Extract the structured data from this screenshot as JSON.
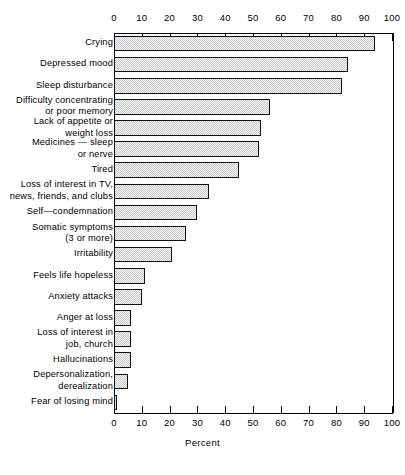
{
  "chart_data": {
    "type": "bar",
    "orientation": "horizontal",
    "title": "",
    "xlabel": "Percent",
    "ylabel": "",
    "xlim": [
      0,
      100
    ],
    "grid": false,
    "legend": null,
    "tick_labels": [
      "0",
      "10",
      "20",
      "30",
      "40",
      "50",
      "60",
      "70",
      "80",
      "90",
      "100"
    ],
    "tick_values": [
      0,
      10,
      20,
      30,
      40,
      50,
      60,
      70,
      80,
      90,
      100
    ],
    "categories": [
      "Crying",
      "Depressed mood",
      "Sleep disturbance",
      "Difficulty concentrating\nor poor memory",
      "Lack of appetite or\nweight loss",
      "Medicines — sleep\nor nerve",
      "Tired",
      "Loss of interest in TV,\nnews, friends, and clubs",
      "Self—condemnation",
      "Somatic symptoms\n(3 or more)",
      "Irritability",
      "Feels life hopeless",
      "Anxiety attacks",
      "Anger at loss",
      "Loss of interest in\njob, church",
      "Hallucinations",
      "Depersonalization,\nderealization",
      "Fear of losing mind"
    ],
    "values": [
      94,
      84,
      82,
      56,
      53,
      52,
      45,
      34,
      30,
      26,
      21,
      11,
      10,
      6,
      6,
      6,
      5,
      1
    ]
  }
}
